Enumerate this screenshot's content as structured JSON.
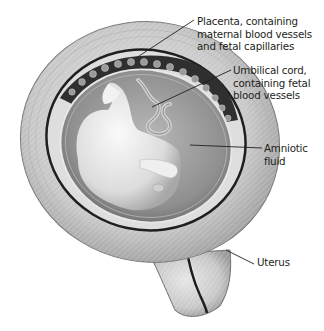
{
  "figure": {
    "labels": {
      "placenta": [
        "Placenta, containing",
        "maternal blood vessels",
        "and fetal capillaries"
      ],
      "umbilical_cord": [
        "Umbilical cord,",
        "containing fetal",
        "blood vessels"
      ],
      "amniotic_fluid": [
        "Amniotic",
        "fluid"
      ],
      "uterus": [
        "Uterus"
      ]
    },
    "caption": "Figure … (cut off, illegible)",
    "colors": {
      "background": "#ffffff",
      "uterus_wall": "#c9c9c9",
      "uterus_wall_dark": "#8a8a8a",
      "placenta": "#3a3a3a",
      "amniotic_fluid": "#9a9a9a",
      "fetus": "#e8e8e8",
      "label_text": "#231f20",
      "leader_line": "#231f20"
    }
  }
}
